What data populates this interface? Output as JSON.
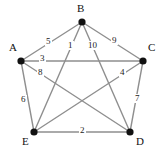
{
  "figure": {
    "background_color": "#ffffff",
    "edge_color": "#8f8f8f",
    "vertex_color": "#111111",
    "label_color": "#111111",
    "width": 164,
    "height": 155
  },
  "chart_data": {
    "type": "diagram",
    "diagram_type": "weighted-undirected-graph",
    "title": "",
    "nodes": [
      {
        "id": "A",
        "label": "A",
        "x": 21,
        "y": 61,
        "label_x": 9,
        "label_y": 42
      },
      {
        "id": "B",
        "label": "B",
        "x": 82,
        "y": 22,
        "label_x": 77,
        "label_y": 3
      },
      {
        "id": "C",
        "label": "C",
        "x": 143,
        "y": 61,
        "label_x": 148,
        "label_y": 42
      },
      {
        "id": "D",
        "label": "D",
        "x": 130,
        "y": 132,
        "label_x": 136,
        "label_y": 136
      },
      {
        "id": "E",
        "label": "E",
        "x": 34,
        "y": 132,
        "label_x": 22,
        "label_y": 136
      }
    ],
    "edges": [
      {
        "from": "A",
        "to": "B",
        "weight": "5",
        "label_x": 45,
        "label_y": 37
      },
      {
        "from": "B",
        "to": "E",
        "weight": "1",
        "label_x": 67,
        "label_y": 41
      },
      {
        "from": "B",
        "to": "D",
        "weight": "10",
        "label_x": 87,
        "label_y": 41
      },
      {
        "from": "B",
        "to": "C",
        "weight": "9",
        "label_x": 111,
        "label_y": 36
      },
      {
        "from": "A",
        "to": "C",
        "weight": "3",
        "label_x": 39,
        "label_y": 54
      },
      {
        "from": "A",
        "to": "D",
        "weight": "8",
        "label_x": 37,
        "label_y": 68
      },
      {
        "from": "C",
        "to": "E",
        "weight": "4",
        "label_x": 119,
        "label_y": 68
      },
      {
        "from": "C",
        "to": "D",
        "weight": "7",
        "label_x": 134,
        "label_y": 94
      },
      {
        "from": "A",
        "to": "E",
        "weight": "6",
        "label_x": 20,
        "label_y": 95
      },
      {
        "from": "E",
        "to": "D",
        "weight": "2",
        "label_x": 79,
        "label_y": 126
      }
    ],
    "node_count": 5,
    "edge_count": 10,
    "weights": [
      5,
      1,
      10,
      9,
      3,
      8,
      4,
      7,
      6,
      2
    ]
  }
}
